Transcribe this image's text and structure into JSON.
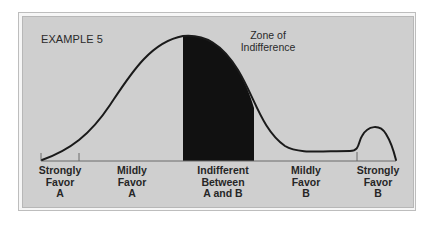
{
  "example_label": "EXAMPLE 5",
  "zone_label": {
    "line1": "Zone of",
    "line2": "Indifference"
  },
  "categories": [
    {
      "line1": "Strongly",
      "line2": "Favor",
      "line3": "A"
    },
    {
      "line1": "Mildly",
      "line2": "Favor",
      "line3": "A"
    },
    {
      "line1": "Indifferent",
      "line2": "Between",
      "line3": "A and B"
    },
    {
      "line1": "Mildly",
      "line2": "Favor",
      "line3": "B"
    },
    {
      "line1": "Strongly",
      "line2": "Favor",
      "line3": "B"
    }
  ],
  "colors": {
    "panel": "#cfcfcf",
    "curve": "#1a1a1a",
    "zone_fill": "#111111",
    "text": "#262626"
  }
}
